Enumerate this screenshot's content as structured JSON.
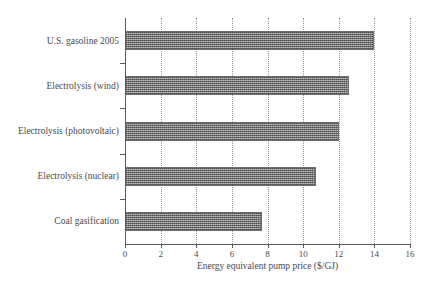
{
  "chart_data": {
    "type": "bar",
    "orientation": "horizontal",
    "title": "",
    "subtitle": "",
    "xlabel": "Energy equivalent pump price ($/GJ)",
    "ylabel": "",
    "categories": [
      "U.S. gasoline 2005",
      "Electrolysis (wind)",
      "Electrolysis (photovoltaic)",
      "Electrolysis (nuclear)",
      "Coal gasification"
    ],
    "values": [
      14.0,
      12.6,
      12.0,
      10.7,
      7.7
    ],
    "xlim": [
      0,
      16
    ],
    "xticks": [
      0,
      2,
      4,
      6,
      8,
      10,
      12,
      14,
      16
    ],
    "xtick_labels": [
      "0",
      "2",
      "4",
      "6",
      "8",
      "10",
      "12",
      "14",
      "16"
    ],
    "grid": "vertical-dotted",
    "legend": "none",
    "bar_fill": "#8c8c8c",
    "bar_pattern": "dither-checker",
    "axis_color": "#5a5a5a",
    "text_color": "#4a4a4a",
    "background": "#ffffff"
  }
}
